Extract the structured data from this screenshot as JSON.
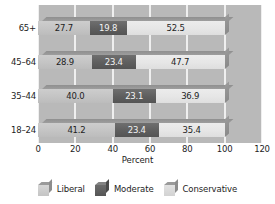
{
  "chart_data": {
    "type": "bar",
    "orientation": "horizontal",
    "stacked": true,
    "title": "",
    "xlabel": "Percent",
    "ylabel": "",
    "xlim": [
      0,
      120
    ],
    "xticks": [
      0,
      20,
      40,
      60,
      80,
      100,
      120
    ],
    "grid": true,
    "legend_position": "bottom",
    "categories": [
      "18–24",
      "35–44",
      "45–64",
      "65+"
    ],
    "series": [
      {
        "name": "Liberal",
        "color": "#c4c4c4",
        "values": [
          41.2,
          40.0,
          28.9,
          27.7
        ]
      },
      {
        "name": "Moderate",
        "color": "#5e5e5e",
        "values": [
          23.4,
          23.1,
          23.4,
          19.8
        ]
      },
      {
        "name": "Conservative",
        "color": "#e6e6e6",
        "values": [
          35.4,
          36.9,
          47.7,
          52.5
        ]
      }
    ],
    "rows": [
      {
        "category": "65+",
        "segments": [
          {
            "series": "Liberal",
            "value": 27.7,
            "label": "27.7"
          },
          {
            "series": "Moderate",
            "value": 19.8,
            "label": "19.8"
          },
          {
            "series": "Conservative",
            "value": 52.5,
            "label": "52.5"
          }
        ]
      },
      {
        "category": "45–64",
        "segments": [
          {
            "series": "Liberal",
            "value": 28.9,
            "label": "28.9"
          },
          {
            "series": "Moderate",
            "value": 23.4,
            "label": "23.4"
          },
          {
            "series": "Conservative",
            "value": 47.7,
            "label": "47.7"
          }
        ]
      },
      {
        "category": "35–44",
        "segments": [
          {
            "series": "Liberal",
            "value": 40.0,
            "label": "40.0"
          },
          {
            "series": "Moderate",
            "value": 23.1,
            "label": "23.1"
          },
          {
            "series": "Conservative",
            "value": 36.9,
            "label": "36.9"
          }
        ]
      },
      {
        "category": "18–24",
        "segments": [
          {
            "series": "Liberal",
            "value": 41.2,
            "label": "41.2"
          },
          {
            "series": "Moderate",
            "value": 23.4,
            "label": "23.4"
          },
          {
            "series": "Conservative",
            "value": 35.4,
            "label": "35.4"
          }
        ]
      }
    ]
  },
  "axis": {
    "x_title": "Percent",
    "x_ticks": [
      "0",
      "20",
      "40",
      "60",
      "80",
      "100",
      "120"
    ],
    "y_ticks": [
      "65+",
      "45–64",
      "35–44",
      "18–24"
    ]
  },
  "legend": {
    "items": [
      {
        "label": "Liberal"
      },
      {
        "label": "Moderate"
      },
      {
        "label": "Conservative"
      }
    ]
  },
  "colors": {
    "plot_background": "#b9b9b9",
    "gridline": "#f1f1f1",
    "liberal": "#c4c4c4",
    "moderate": "#5e5e5e",
    "conservative": "#e6e6e6"
  }
}
